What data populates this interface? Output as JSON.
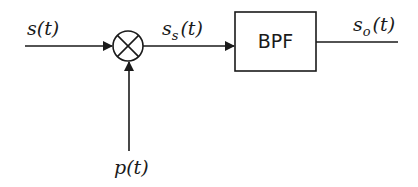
{
  "diagram": {
    "type": "block-diagram",
    "inputs": {
      "signal": {
        "base": "s",
        "sub": "",
        "arg": "(t)"
      },
      "carrier": {
        "base": "p",
        "sub": "",
        "arg": "(t)"
      }
    },
    "mixer": {
      "symbol": "multiplier"
    },
    "intermediate": {
      "base": "s",
      "sub": "s",
      "arg": "(t)"
    },
    "filter": {
      "label": "BPF"
    },
    "output": {
      "base": "s",
      "sub": "o",
      "arg": "(t)"
    },
    "colors": {
      "stroke": "#1a1a1a",
      "background": "#ffffff"
    }
  }
}
